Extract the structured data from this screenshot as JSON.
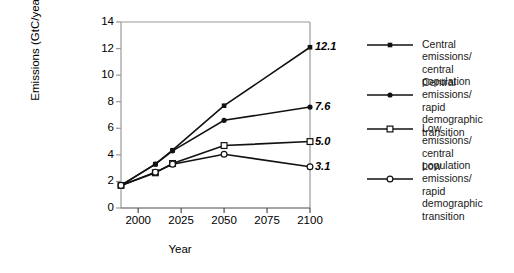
{
  "chart_data": {
    "type": "line",
    "title": "",
    "xlabel": "Year",
    "ylabel": "Emissions (GtC/year)",
    "xlim": [
      1990,
      2100
    ],
    "ylim": [
      0,
      14
    ],
    "xticks": [
      "2000",
      "2025",
      "2050",
      "2075",
      "2100"
    ],
    "xtick_values": [
      2000,
      2025,
      2050,
      2075,
      2100
    ],
    "yticks": [
      "0",
      "2",
      "4",
      "6",
      "8",
      "10",
      "12",
      "14"
    ],
    "ytick_values": [
      0,
      2,
      4,
      6,
      8,
      10,
      12,
      14
    ],
    "grid": false,
    "legend_position": "right",
    "x": [
      1990,
      2010,
      2020,
      2050,
      2100
    ],
    "series": [
      {
        "name": "Central emissions/\ncentral population",
        "marker": "filled-square",
        "values": [
          1.7,
          3.3,
          4.35,
          7.7,
          12.1
        ],
        "end_label": "12.1"
      },
      {
        "name": "Central emissions/\nrapid demographic\ntransition",
        "marker": "filled-circle",
        "values": [
          1.7,
          3.3,
          4.3,
          6.6,
          7.6
        ],
        "end_label": "7.6"
      },
      {
        "name": "Low emissions/\ncentral population",
        "marker": "open-square",
        "values": [
          1.7,
          2.65,
          3.35,
          4.7,
          5.0
        ],
        "end_label": "5.0"
      },
      {
        "name": "Low emissions/\nrapid demographic\ntransition",
        "marker": "open-circle",
        "values": [
          1.7,
          2.7,
          3.3,
          4.05,
          3.1
        ],
        "end_label": "3.1"
      }
    ],
    "colors": {
      "line": "#111111",
      "axis": "#9a9a9a",
      "xaxis": "#4d4d4d",
      "marker_fill": "#111111",
      "marker_open": "#ffffff",
      "text": "#000000"
    }
  },
  "legend": {
    "items": [
      {
        "label": "Central emissions/\ncentral population",
        "marker": "filled-square"
      },
      {
        "label": "Central emissions/\nrapid demographic\ntransition",
        "marker": "filled-circle"
      },
      {
        "label": "Low emissions/\ncentral population",
        "marker": "open-square"
      },
      {
        "label": "Low emissions/\nrapid demographic\ntransition",
        "marker": "open-circle"
      }
    ]
  }
}
